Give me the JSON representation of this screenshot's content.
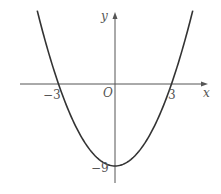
{
  "chart_data": {
    "type": "line",
    "title": "",
    "function": "y = x^2 - 9",
    "xlabel": "x",
    "ylabel": "y",
    "origin_label": "O",
    "x_ticks": [
      {
        "value": -3,
        "label": "-3"
      },
      {
        "value": 3,
        "label": "3"
      }
    ],
    "y_ticks": [
      {
        "value": -9,
        "label": "-9"
      }
    ],
    "points": [
      {
        "x": -3,
        "y": 0
      },
      {
        "x": 0,
        "y": -9
      },
      {
        "x": 3,
        "y": 0
      }
    ],
    "xlim": [
      -5,
      5
    ],
    "ylim": [
      -11,
      11
    ],
    "grid": false,
    "legend": null
  },
  "labels": {
    "x_axis": "x",
    "y_axis": "y",
    "origin": "O",
    "neg_three": "−3",
    "pos_three": "3",
    "neg_nine": "−9"
  }
}
